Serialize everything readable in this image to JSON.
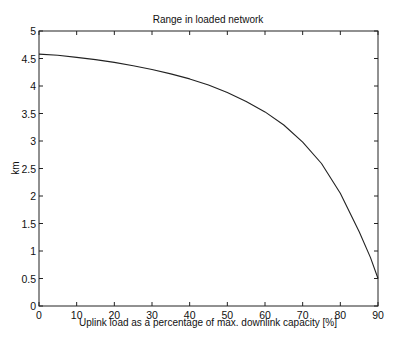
{
  "chart_data": {
    "type": "line",
    "title": "Range in loaded network",
    "xlabel": "Uplink load as a percentage of max. downlink capacity [%]",
    "ylabel": "km",
    "xlim": [
      0,
      90
    ],
    "ylim": [
      0,
      5
    ],
    "xticks": [
      0,
      10,
      20,
      30,
      40,
      50,
      60,
      70,
      80,
      90
    ],
    "yticks": [
      0,
      0.5,
      1,
      1.5,
      2,
      2.5,
      3,
      3.5,
      4,
      4.5,
      5
    ],
    "xtick_labels": [
      "0",
      "10",
      "20",
      "30",
      "40",
      "50",
      "60",
      "70",
      "80",
      "90"
    ],
    "ytick_labels": [
      "0",
      "0.5",
      "1",
      "1.5",
      "2",
      "2.5",
      "3",
      "3.5",
      "4",
      "4.5",
      "5"
    ],
    "grid": false,
    "legend": null,
    "series": [
      {
        "name": "range",
        "x": [
          0,
          5,
          10,
          15,
          20,
          25,
          30,
          35,
          40,
          45,
          50,
          55,
          60,
          65,
          70,
          75,
          80,
          85,
          88,
          90
        ],
        "y": [
          4.58,
          4.56,
          4.52,
          4.48,
          4.43,
          4.37,
          4.3,
          4.22,
          4.13,
          4.02,
          3.88,
          3.72,
          3.53,
          3.29,
          2.98,
          2.59,
          2.05,
          1.35,
          0.88,
          0.5
        ]
      }
    ]
  }
}
